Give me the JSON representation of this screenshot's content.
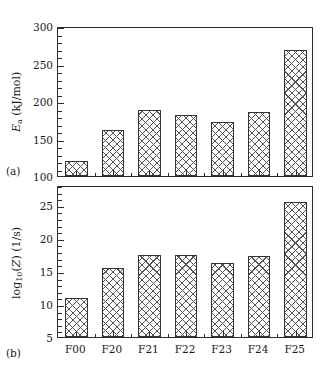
{
  "figure": {
    "panel_a_letter": "(a)",
    "panel_b_letter": "(b)"
  },
  "chart_data": [
    {
      "type": "bar",
      "panel": "(a)",
      "title": "",
      "xlabel": "",
      "ylabel": "E_a (kJ/mol)",
      "categories": [
        "F00",
        "F20",
        "F21",
        "F22",
        "F23",
        "F24",
        "F25"
      ],
      "values": [
        120,
        162,
        188,
        182,
        172,
        186,
        268
      ],
      "ylim": [
        100,
        300
      ],
      "yticks": [
        100,
        150,
        200,
        250,
        300
      ],
      "ytick_labels": [
        "100",
        "150",
        "200",
        "250",
        "300"
      ],
      "y_minor_interval": 10,
      "grid": false,
      "legend": null,
      "bar_fill": "crosshatch",
      "bar_edge_color": "#333333"
    },
    {
      "type": "bar",
      "panel": "(b)",
      "title": "",
      "xlabel": "",
      "ylabel": "log10(Z) (1/s)",
      "categories": [
        "F00",
        "F20",
        "F21",
        "F22",
        "F23",
        "F24",
        "F25"
      ],
      "values": [
        10.9,
        15.5,
        17.4,
        17.4,
        16.2,
        17.2,
        25.4
      ],
      "ylim": [
        5,
        28
      ],
      "yticks": [
        5,
        10,
        15,
        20,
        25
      ],
      "ytick_labels": [
        "5",
        "10",
        "15",
        "20",
        "25"
      ],
      "y_minor_interval": 1,
      "grid": false,
      "legend": null,
      "bar_fill": "crosshatch",
      "bar_edge_color": "#333333"
    }
  ]
}
